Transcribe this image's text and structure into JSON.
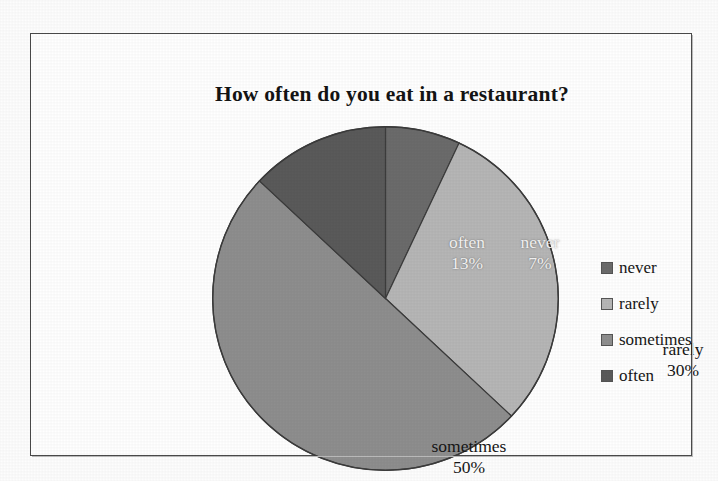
{
  "frame": {
    "border_color": "#4a4a4a",
    "background": "#ffffff"
  },
  "chart_data": {
    "type": "pie",
    "title": "How often do you eat in a restaurant?",
    "xlabel": "",
    "ylabel": "",
    "categories": [
      "never",
      "rarely",
      "sometimes",
      "often"
    ],
    "values": [
      7,
      30,
      50,
      13
    ],
    "value_unit": "%",
    "start_angle_deg": 0,
    "direction": "clockwise",
    "legend_position": "right",
    "grid": false,
    "slices": [
      {
        "label": "never",
        "value": 7,
        "value_text": "7%",
        "color": "#6b6b6b",
        "label_color": "light",
        "start_deg": 0,
        "end_deg": 25.2
      },
      {
        "label": "rarely",
        "value": 30,
        "value_text": "30%",
        "color": "#b6b6b6",
        "label_color": "dark",
        "start_deg": 25.2,
        "end_deg": 133.2
      },
      {
        "label": "sometimes",
        "value": 50,
        "value_text": "50%",
        "color": "#8e8e8e",
        "label_color": "dark",
        "start_deg": 133.2,
        "end_deg": 313.2
      },
      {
        "label": "often",
        "value": 13,
        "value_text": "13%",
        "color": "#5a5a5a",
        "label_color": "light",
        "start_deg": 313.2,
        "end_deg": 360
      }
    ]
  },
  "title": {
    "text": "How often do you eat in a restaurant?"
  },
  "pie_labels": {
    "never": {
      "name": "never",
      "percent": "7%"
    },
    "rarely": {
      "name": "rarely",
      "percent": "30%"
    },
    "sometimes": {
      "name": "sometimes",
      "percent": "50%"
    },
    "often": {
      "name": "often",
      "percent": "13%"
    }
  },
  "legend": {
    "items": [
      {
        "label": "never",
        "color": "#6b6b6b"
      },
      {
        "label": "rarely",
        "color": "#b6b6b6"
      },
      {
        "label": "sometimes",
        "color": "#8e8e8e"
      },
      {
        "label": "often",
        "color": "#5a5a5a"
      }
    ]
  }
}
